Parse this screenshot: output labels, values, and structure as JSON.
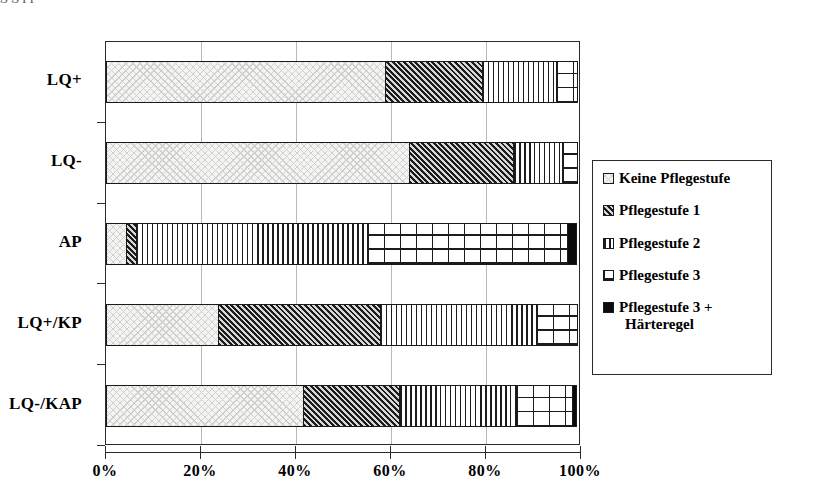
{
  "top_cut_text": "g   g                                                 pp",
  "chart_data": {
    "type": "bar",
    "orientation": "horizontal",
    "stacked": true,
    "normalized": true,
    "title": "",
    "xlabel": "",
    "ylabel": "",
    "xlim": [
      0,
      100
    ],
    "grid": true,
    "legend_position": "right",
    "categories": [
      "LQ+",
      "LQ-",
      "AP",
      "LQ+/KP",
      "LQ-/KAP"
    ],
    "xticks": [
      "0%",
      "20%",
      "40%",
      "60%",
      "80%",
      "100%"
    ],
    "xtick_values": [
      0,
      20,
      40,
      60,
      80,
      100
    ],
    "series": [
      {
        "name": "Keine Pflegestufe",
        "pattern": "dots",
        "values": [
          59,
          64,
          4.4,
          23.8,
          41.7
        ]
      },
      {
        "name": "Pflegestufe 1",
        "pattern": "diagonal",
        "values": [
          20.6,
          22.1,
          2.3,
          34.3,
          20.4
        ]
      },
      {
        "name": "Pflegestufe 2",
        "pattern": "vertical",
        "values": [
          15.8,
          10.5,
          48.8,
          33.1,
          24.8
        ]
      },
      {
        "name": "Pflegestufe 3",
        "pattern": "grid",
        "values": [
          4.6,
          3.4,
          42.5,
          8.8,
          12.1
        ]
      },
      {
        "name": "Pflegestufe 3 + Härteregel",
        "pattern": "black",
        "values": [
          0,
          0,
          2.0,
          0,
          1.0
        ]
      }
    ]
  },
  "legend": {
    "items": [
      {
        "label": "Keine Pflegestufe",
        "label_line2": "",
        "pattern": "dots"
      },
      {
        "label": "Pflegestufe 1",
        "label_line2": "",
        "pattern": "diagonal"
      },
      {
        "label": "Pflegestufe 2",
        "label_line2": "",
        "pattern": "vertical"
      },
      {
        "label": "Pflegestufe 3",
        "label_line2": "",
        "pattern": "grid"
      },
      {
        "label": "Pflegestufe 3 +",
        "label_line2": "Härteregel",
        "pattern": "black"
      }
    ]
  }
}
